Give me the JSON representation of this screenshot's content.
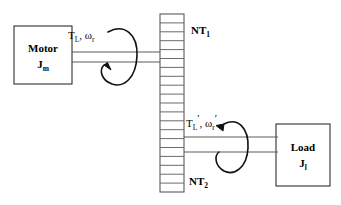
{
  "diagram": {
    "stroke_color": "#000000",
    "background_color": "#ffffff",
    "blocks": [
      {
        "name": "motor",
        "line1": "Motor",
        "line2_base": "J",
        "line2_sub": "m",
        "x": 14,
        "y": 26,
        "w": 58,
        "h": 58
      },
      {
        "name": "load",
        "line1": "Load",
        "line2_base": "J",
        "line2_sub": "l",
        "x": 276,
        "y": 124,
        "w": 54,
        "h": 62
      }
    ],
    "gear": {
      "name": "gear-rack",
      "x": 160,
      "y": 14,
      "w": 24,
      "h": 178,
      "teeth_count": 20
    },
    "gear_labels": [
      {
        "name": "gear-ratio-top",
        "base": "NT",
        "sub": "1",
        "x": 191,
        "y": 24
      },
      {
        "name": "gear-ratio-bottom",
        "base": "NT",
        "sub": "2",
        "x": 189,
        "y": 175
      }
    ],
    "annotations": [
      {
        "name": "motor-shaft-torque-speed",
        "torque_base": "T",
        "torque_sub": "L",
        "torque_prime": "",
        "separator": ", ",
        "speed_base": "ω",
        "speed_sub": "r",
        "speed_prime": "",
        "x": 68,
        "y": 25
      },
      {
        "name": "load-shaft-torque-speed",
        "torque_base": "T",
        "torque_sub": "L",
        "torque_prime": "′",
        "separator": ", ",
        "speed_base": "ω",
        "speed_sub": "r",
        "speed_prime": "′",
        "x": 186,
        "y": 113
      }
    ],
    "shafts": [
      {
        "name": "motor-shaft",
        "x1": 72,
        "x2": 162,
        "y_top": 52,
        "y_bottom": 62
      },
      {
        "name": "load-shaft",
        "x1": 182,
        "x2": 278,
        "y_top": 137,
        "y_bottom": 152
      }
    ],
    "rotation_arrows": [
      {
        "name": "motor-rotation-arrow",
        "cx": 118,
        "cy": 57,
        "rx": 17,
        "ry": 29
      },
      {
        "name": "load-rotation-arrow",
        "cx": 231,
        "cy": 146,
        "rx": 16,
        "ry": 27
      }
    ]
  }
}
